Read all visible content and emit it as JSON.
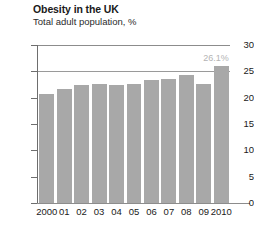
{
  "header": {
    "title": "Obesity in the UK",
    "subtitle": "Total adult population, %"
  },
  "chart_data": {
    "type": "bar",
    "title": "Obesity in the UK",
    "subtitle": "Total adult population, %",
    "xlabel": "",
    "ylabel": "",
    "categories": [
      "2000",
      "01",
      "02",
      "03",
      "04",
      "05",
      "06",
      "07",
      "08",
      "09",
      "2010"
    ],
    "values": [
      20.7,
      21.6,
      22.5,
      22.6,
      22.5,
      22.6,
      23.4,
      23.6,
      24.3,
      22.6,
      26.1
    ],
    "ylim": [
      0,
      30
    ],
    "yticks": [
      0,
      5,
      10,
      15,
      20,
      25,
      30
    ],
    "ytick_labels": [
      "0",
      "5",
      "10",
      "15",
      "20",
      "25",
      "30"
    ],
    "grid": true,
    "gridlines_at": [
      25,
      30
    ],
    "legend": null,
    "bar_color": "#a8a8a8",
    "annotations": [
      {
        "label": "26.1%",
        "category": "2010",
        "value": 26.1,
        "color": "#b4b4b4"
      }
    ]
  }
}
